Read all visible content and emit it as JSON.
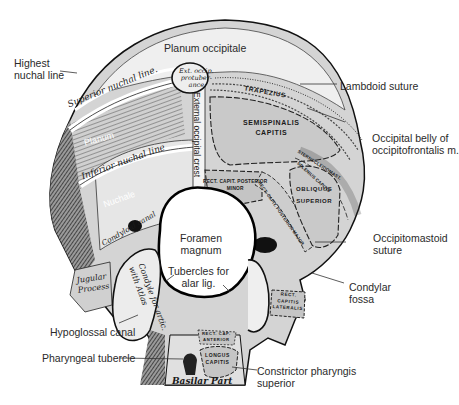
{
  "figure": {
    "colors": {
      "bone": "#d9d9d9",
      "bone_dark": "#3a3a3a",
      "muscle_area": "#c8c8c8",
      "outline": "#111111",
      "leader_line": "#333333",
      "label_text": "#2a2a2a"
    }
  },
  "labels": {
    "planum_occipitale": "Planum occipitale",
    "highest_nuchal_line": "Highest\nnuchal line",
    "lambdoid_suture": "Lambdoid suture",
    "occipital_belly": "Occipital belly of\noccipitofrontalis m.",
    "occipitomastoid_suture": "Occipitomastoid\nsuture",
    "condylar_fossa": "Condylar\nfossa",
    "foramen_magnum": "Foramen\nmagnum",
    "tubercles_alar": "Tubercles for\nalar lig.",
    "hypoglossal_canal": "Hypoglossal canal",
    "pharyngeal_tubercle": "Pharyngeal tubercle",
    "constrictor_pharyngis": "Constrictor pharyngis\nsuperior"
  },
  "inner_labels": {
    "ext_occ_protuberance": "Ext. occip.\nprotuber-\nance",
    "superior_nuchal_line": "Superior nuchal line.",
    "planum": "Planum",
    "inferior_nuchal_line": "Inferior nuchal line",
    "nuchale": "Nuchale",
    "external_occipital_crest": "External occipital crest",
    "condyloid_canal": "Condyloid canal",
    "jugular_process": "Jugular\nProcess",
    "condyle": "Condyle for artic.\nwith Atlas",
    "basilar_part": "Basilar Part"
  },
  "muscle_labels": {
    "trapezius": "TRAPEZIUS",
    "semispinalis": "SEMISPINALIS\nCAPITIS",
    "rect_minor": "RECT. CAPIT. POSTERIOR\nMINOR",
    "rect_major": "RECT. CAPIT. POSTERIOR MAJOR",
    "obliquus": "OBLIQUUS\nSUPERIOR",
    "sternocleido": "STERNOCLEIDOMAST.",
    "splenius": "SPLENIUS CAPITIS",
    "rect_lateralis": "RECT.\nCAPITIS\nLATERALIS",
    "rect_anterior": "RECT. CAP.\nANTERIOR",
    "longus_capitis": "LONGUS\nCAPITIS"
  }
}
